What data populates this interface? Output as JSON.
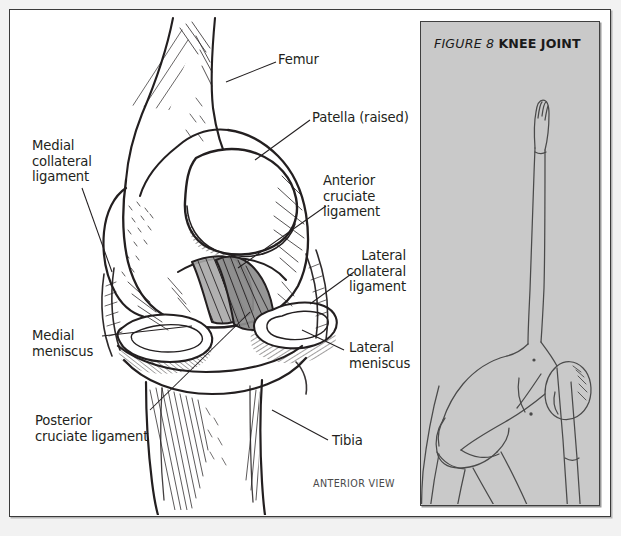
{
  "figure": {
    "panel_title_prefix": "FIGURE 8",
    "panel_title_name": "KNEE JOINT",
    "view_caption": "ANTERIOR VIEW",
    "pose_name": "triangle-pose-figure",
    "panel_background": "#c9c9c9",
    "frame_border_color": "#3a3a3a",
    "ink_color": "#231f20"
  },
  "labels": {
    "femur": "Femur",
    "patella": "Patella (raised)",
    "medial_collateral_ligament": "Medial\ncollateral\nligament",
    "anterior_cruciate_ligament": "Anterior\ncruciate ligament",
    "lateral_collateral_ligament": "Lateral\ncollateral\nligament",
    "medial_meniscus": "Medial\nmeniscus",
    "lateral_meniscus": "Lateral\nmeniscus",
    "posterior_cruciate_ligament": "Posterior\ncruciate ligament",
    "tibia": "Tibia"
  }
}
